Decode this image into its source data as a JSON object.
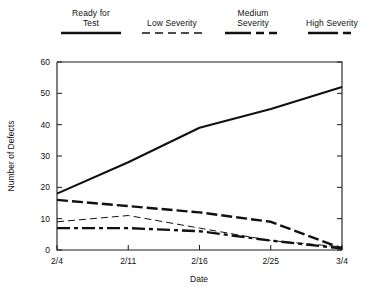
{
  "chart_data": {
    "type": "line",
    "title": "",
    "xlabel": "Date",
    "ylabel": "Number of Defects",
    "x": [
      "2/4",
      "2/11",
      "2/16",
      "2/25",
      "3/4"
    ],
    "x_tick_labels": [
      "2/4",
      "2/11",
      "2/16",
      "2/25",
      "3/4"
    ],
    "y_tick_labels": [
      "0",
      "10",
      "20",
      "30",
      "40",
      "50",
      "60"
    ],
    "y_ticks": [
      0,
      10,
      20,
      30,
      40,
      50,
      60
    ],
    "ylim": [
      0,
      60
    ],
    "grid": false,
    "legend_position": "top",
    "series": [
      {
        "name": "Ready for\nTest",
        "label_line1": "Ready for",
        "label_line2": "Test",
        "style": "solid",
        "values": [
          18,
          28,
          39,
          45,
          52
        ]
      },
      {
        "name": "Low Severity",
        "label_line1": "Low Severity",
        "label_line2": "",
        "style": "dashed-thin",
        "values": [
          9,
          11,
          7,
          3,
          1
        ]
      },
      {
        "name": "Medium\nSeverity",
        "label_line1": "Medium",
        "label_line2": "Severity",
        "style": "dashed-thick",
        "values": [
          16,
          14,
          12,
          9,
          0.5
        ]
      },
      {
        "name": "High Severity",
        "label_line1": "High Severity",
        "label_line2": "",
        "style": "dash-dot-thick",
        "values": [
          7,
          7,
          6,
          3,
          0.5
        ]
      }
    ]
  },
  "legend": {
    "items": [
      {
        "line1": "Ready for",
        "line2": "Test",
        "swatch": "solid-line-icon"
      },
      {
        "line1": "Low Severity",
        "line2": "",
        "swatch": "dashed-thin-line-icon"
      },
      {
        "line1": "Medium",
        "line2": "Severity",
        "swatch": "dashed-thick-line-icon"
      },
      {
        "line1": "High Severity",
        "line2": "",
        "swatch": "dash-dot-line-icon"
      }
    ]
  },
  "colors": {
    "ink": "#111111",
    "background": "#ffffff"
  }
}
